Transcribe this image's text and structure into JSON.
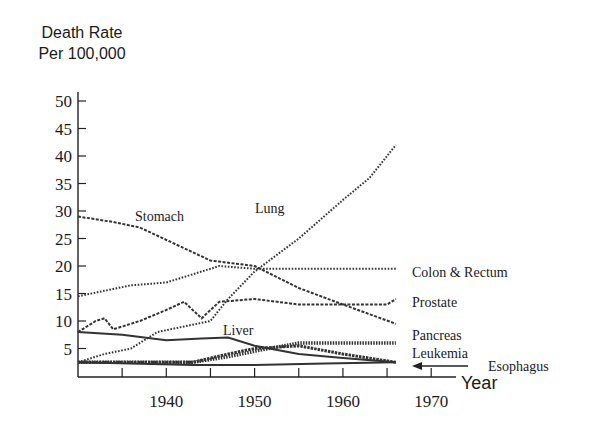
{
  "chart_data": {
    "type": "line",
    "title": "",
    "ylabel_line1": "Death Rate",
    "ylabel_line2": "Per 100,000",
    "xlabel": "Year",
    "xlim": [
      1930,
      1975
    ],
    "ylim": [
      0,
      50
    ],
    "grid": false,
    "legend": "inline labels at right end of each series",
    "y_ticks": [
      5,
      10,
      15,
      20,
      25,
      30,
      35,
      40,
      45,
      50
    ],
    "y_tick_labels": [
      "5",
      "10",
      "15",
      "20",
      "25",
      "30",
      "35",
      "40",
      "45",
      "50"
    ],
    "x_minor_ticks": [
      1935,
      1940,
      1945,
      1950,
      1955,
      1960,
      1965,
      1970
    ],
    "x_tick_labels": [
      {
        "year": 1940,
        "label": "1940"
      },
      {
        "year": 1950,
        "label": "1950"
      },
      {
        "year": 1960,
        "label": "1960"
      },
      {
        "year": 1970,
        "label": "1970"
      }
    ],
    "series": [
      {
        "name": "Stomach",
        "style": "dashed",
        "points": [
          [
            1930,
            29
          ],
          [
            1934,
            28
          ],
          [
            1937,
            27
          ],
          [
            1941,
            24
          ],
          [
            1945,
            21
          ],
          [
            1950,
            20
          ],
          [
            1955,
            16
          ],
          [
            1960,
            13
          ],
          [
            1966,
            9.5
          ]
        ]
      },
      {
        "name": "Lung",
        "style": "dotted",
        "points": [
          [
            1930,
            2.5
          ],
          [
            1933,
            4
          ],
          [
            1936,
            5
          ],
          [
            1939,
            8
          ],
          [
            1942,
            9
          ],
          [
            1945,
            10
          ],
          [
            1947,
            14
          ],
          [
            1950,
            19
          ],
          [
            1955,
            25
          ],
          [
            1960,
            32
          ],
          [
            1963,
            36
          ],
          [
            1966,
            42
          ]
        ]
      },
      {
        "name": "Colon & Rectum",
        "style": "dotted",
        "points": [
          [
            1930,
            14.5
          ],
          [
            1933,
            15.5
          ],
          [
            1936,
            16.5
          ],
          [
            1940,
            17
          ],
          [
            1943,
            18.5
          ],
          [
            1946,
            20
          ],
          [
            1950,
            19.5
          ],
          [
            1960,
            19.5
          ],
          [
            1966,
            19.5
          ]
        ]
      },
      {
        "name": "Prostate",
        "style": "dashed",
        "points": [
          [
            1930,
            8
          ],
          [
            1932,
            10
          ],
          [
            1933,
            10.5
          ],
          [
            1934,
            8.5
          ],
          [
            1937,
            10
          ],
          [
            1940,
            12
          ],
          [
            1942,
            13.5
          ],
          [
            1944,
            10.5
          ],
          [
            1946,
            13.5
          ],
          [
            1950,
            14
          ],
          [
            1955,
            13
          ],
          [
            1965,
            13
          ],
          [
            1966,
            14
          ]
        ]
      },
      {
        "name": "Liver",
        "style": "solid",
        "points": [
          [
            1930,
            8
          ],
          [
            1935,
            7.5
          ],
          [
            1940,
            6.5
          ],
          [
            1944,
            6.8
          ],
          [
            1947,
            7
          ],
          [
            1950,
            5.5
          ],
          [
            1955,
            4
          ],
          [
            1960,
            3.3
          ],
          [
            1966,
            2.5
          ]
        ]
      },
      {
        "name": "Pancreas",
        "style": "thick-dotted",
        "points": [
          [
            1930,
            2.5
          ],
          [
            1943,
            2.5
          ],
          [
            1947,
            3.5
          ],
          [
            1950,
            4.5
          ],
          [
            1955,
            6
          ],
          [
            1966,
            6
          ]
        ]
      },
      {
        "name": "Leukemia",
        "style": "thick-dashed",
        "points": [
          [
            1930,
            2.5
          ],
          [
            1943,
            2.5
          ],
          [
            1947,
            4
          ],
          [
            1950,
            5
          ],
          [
            1955,
            5.5
          ],
          [
            1960,
            4
          ],
          [
            1966,
            2.5
          ]
        ]
      },
      {
        "name": "Esophagus",
        "style": "solid",
        "points": [
          [
            1930,
            2.5
          ],
          [
            1943,
            2
          ],
          [
            1950,
            2
          ],
          [
            1958,
            2.3
          ],
          [
            1966,
            2.5
          ]
        ]
      }
    ],
    "annotations": [
      {
        "text": "Stomach",
        "near": "upper-left, above stomach line"
      },
      {
        "text": "Lung",
        "near": "center, left of lung line"
      },
      {
        "text": "Liver",
        "near": "center-low, above liver line"
      },
      {
        "text": "Colon & Rectum",
        "near": "right end"
      },
      {
        "text": "Prostate",
        "near": "right end"
      },
      {
        "text": "Pancreas",
        "near": "right end"
      },
      {
        "text": "Leukemia",
        "near": "right end"
      },
      {
        "text": "Esophagus",
        "near": "right end, with left-pointing arrow"
      }
    ]
  },
  "labels": {
    "stomach": "Stomach",
    "lung": "Lung",
    "liver": "Liver",
    "colon": "Colon & Rectum",
    "prostate": "Prostate",
    "pancreas": "Pancreas",
    "leukemia": "Leukemia",
    "esophagus": "Esophagus"
  }
}
